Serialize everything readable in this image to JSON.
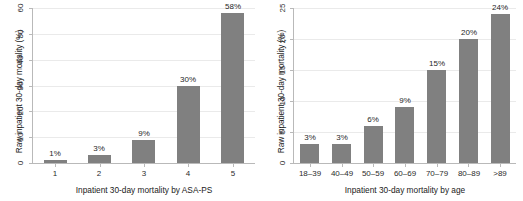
{
  "chart_data": [
    {
      "panel": "left",
      "type": "bar",
      "title": "",
      "xlabel": "Inpatient 30-day mortality by ASA-PS",
      "ylabel": "Raw inpatient 30-day mortality (%)",
      "categories": [
        "1",
        "2",
        "3",
        "4",
        "5"
      ],
      "values": [
        1,
        3,
        9,
        30,
        58
      ],
      "data_labels": [
        "1%",
        "3%",
        "9%",
        "30%",
        "58%"
      ],
      "ylim": [
        0,
        60
      ],
      "yticks": [
        0,
        10,
        20,
        30,
        40,
        50,
        60
      ],
      "ytick_labels": [
        "0",
        "10",
        "20",
        "30",
        "40",
        "50",
        "60"
      ],
      "grid": true,
      "legend": "none",
      "bar_color": "#808080"
    },
    {
      "panel": "right",
      "type": "bar",
      "title": "",
      "xlabel": "Inpatient 30-day mortality by age",
      "ylabel": "Raw inpatient 30-day mortality (%)",
      "categories": [
        "18–39",
        "40–49",
        "50–59",
        "60–69",
        "70–79",
        "80–89",
        ">89"
      ],
      "values": [
        3,
        3,
        6,
        9,
        15,
        20,
        24
      ],
      "data_labels": [
        "3%",
        "3%",
        "6%",
        "9%",
        "15%",
        "20%",
        "24%"
      ],
      "ylim": [
        0,
        25
      ],
      "yticks": [
        0,
        5,
        10,
        15,
        20,
        25
      ],
      "ytick_labels": [
        "0",
        "5",
        "10",
        "15",
        "20",
        "25"
      ],
      "grid": true,
      "legend": "none",
      "bar_color": "#808080"
    }
  ]
}
